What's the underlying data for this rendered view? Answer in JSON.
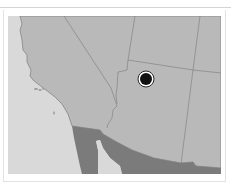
{
  "map": {
    "region": "Southwestern United States",
    "colors": {
      "ocean": "#d9d9d9",
      "us_land": "#b9b9b9",
      "mexico": "#7a7a7a",
      "borders": "#7c7c7c",
      "marker_fill": "#111111",
      "marker_ring": "#ffffff"
    },
    "marker": {
      "icon": "location-dot-icon",
      "x": 146,
      "y": 79
    },
    "islands": [
      "channel-islands",
      "san-clemente-island"
    ]
  }
}
